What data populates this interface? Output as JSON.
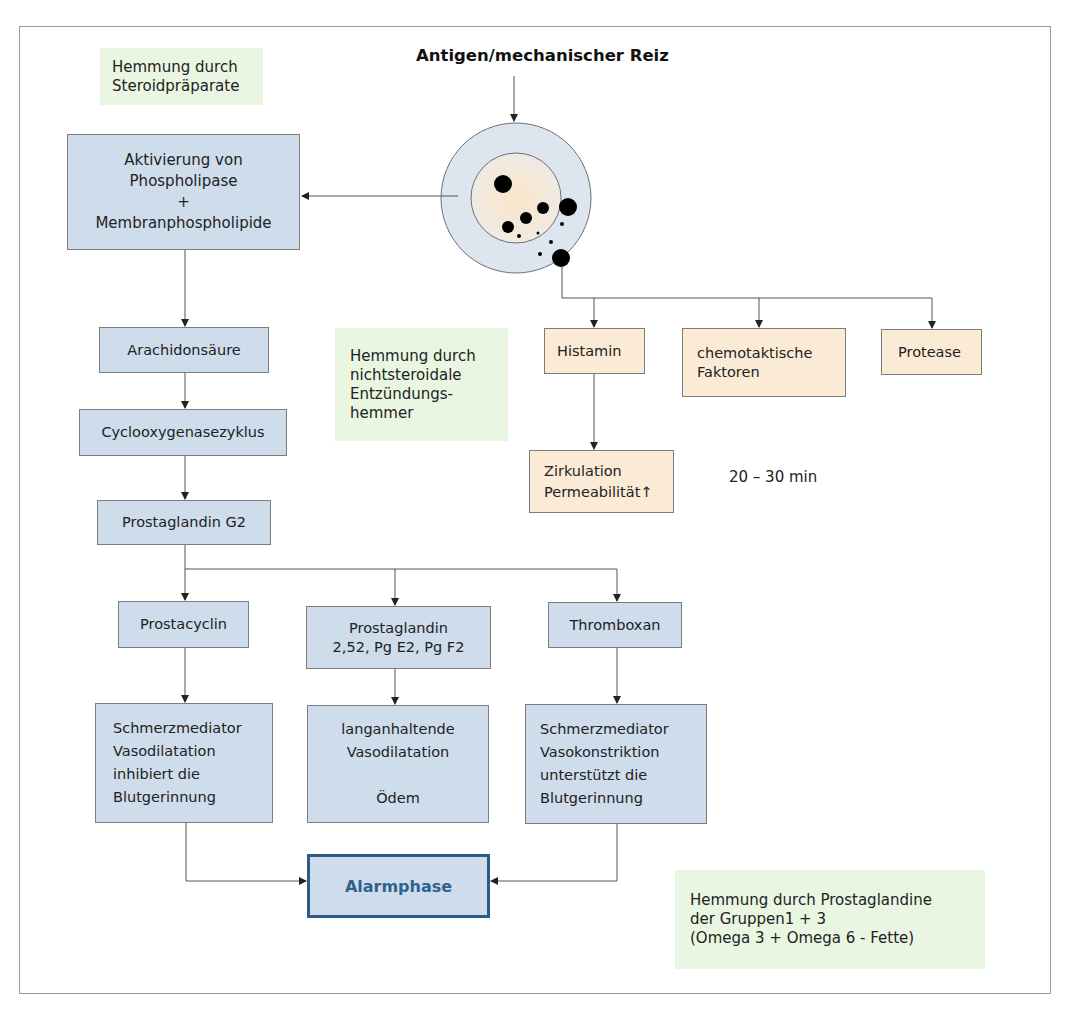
{
  "title": "Antigen/mechanischer Reiz",
  "inhibitions": {
    "steroid": [
      "Hemmung durch",
      "Steroidpräparate"
    ],
    "nsaid": [
      "Hemmung durch",
      "nichtsteroidale",
      "Entzündungs-",
      "hemmer"
    ],
    "prostaglandins": [
      "Hemmung durch Prostaglandine",
      "der Gruppen1 + 3",
      "(Omega 3 + Omega 6 - Fette)"
    ]
  },
  "left_chain": {
    "phospholipase": [
      "Aktivierung von",
      "Phospholipase",
      "+",
      "Membranphospholipide"
    ],
    "arachidon": "Arachidonsäure",
    "cyclo": "Cyclooxygenasezyklus",
    "pg_g2": "Prostaglandin G2"
  },
  "prostanoids": {
    "prostacyclin": "Prostacyclin",
    "prostaglandin": [
      "Prostaglandin",
      "2,52, Pg E2,  Pg F2"
    ],
    "thromboxan": "Thromboxan"
  },
  "effects": {
    "prostacyclin": [
      "Schmerzmediator",
      "Vasodilatation",
      "inhibiert die",
      "Blutgerinnung"
    ],
    "prostaglandin": [
      "langanhaltende",
      "Vasodilatation",
      "",
      "Ödem"
    ],
    "thromboxan": [
      "Schmerzmediator",
      "Vasokonstriktion",
      "unterstützt die",
      "Blutgerinnung"
    ]
  },
  "mast_cell_mediators": {
    "histamin": "Histamin",
    "chemotactic": [
      "chemotaktische",
      "Faktoren"
    ],
    "protease": "Protease",
    "histamin_effect": [
      "Zirkulation",
      "Permeabilität↑"
    ]
  },
  "timing": "20 – 30 min",
  "outcome": "Alarmphase",
  "colors": {
    "process_box": "#cfdcec",
    "mediator_box": "#fbebd6",
    "inhibition_box": "#e9f6e2",
    "outcome_border": "#2c5b86",
    "cell_outer": "#dde6ef",
    "cell_inner": "#f6ecdc"
  }
}
